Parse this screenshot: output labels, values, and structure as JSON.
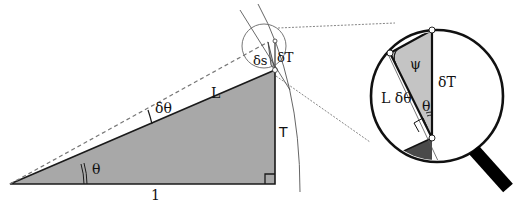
{
  "figure": {
    "labels": {
      "theta": "θ",
      "delta_theta": "δθ",
      "L": "L",
      "base": "1",
      "T": "T",
      "delta_s": "δs",
      "delta_T": "δT",
      "psi": "ψ",
      "L_delta_theta": "L δθ",
      "theta_inset": "θ"
    },
    "colors": {
      "triangle_fill": "#a8a8a8",
      "inset_dark_fill": "#4a4a4a",
      "inset_light_fill": "#c4c4c4",
      "stroke": "#1a1a1a",
      "guide": "#666666"
    }
  }
}
